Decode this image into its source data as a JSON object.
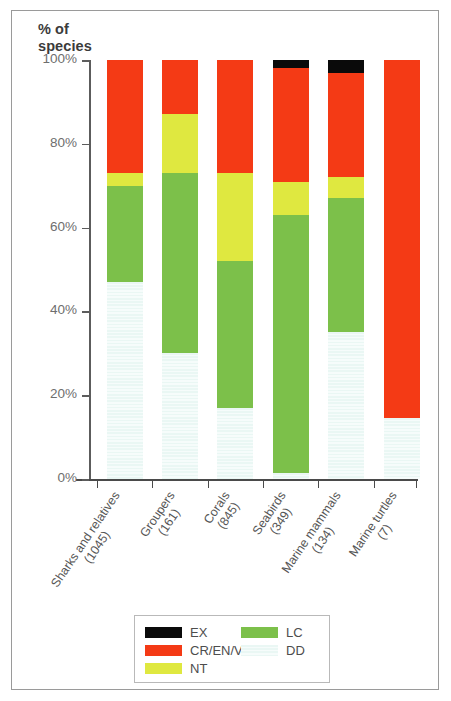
{
  "chart_data": {
    "type": "bar",
    "title": "% of species",
    "xlabel": "",
    "ylabel": "% of species",
    "ylim": [
      0,
      100
    ],
    "grid": false,
    "stacked": true,
    "legend_position": "bottom",
    "y_ticks": [
      "0%",
      "20%",
      "40%",
      "60%",
      "80%",
      "100%"
    ],
    "y_tick_values": [
      0,
      20,
      40,
      60,
      80,
      100
    ],
    "categories": [
      "Sharks and relatives (1045)",
      "Groupers (161)",
      "Corals (845)",
      "Seabirds (349)",
      "Marine mammals (134)",
      "Marine turtles (7)"
    ],
    "category_lines": [
      {
        "line1": "Sharks and relatives",
        "line2": "(1045)"
      },
      {
        "line1": "Groupers",
        "line2": "(161)"
      },
      {
        "line1": "Corals",
        "line2": "(845)"
      },
      {
        "line1": "Seabirds",
        "line2": "(349)"
      },
      {
        "line1": "Marine mammals",
        "line2": "(134)"
      },
      {
        "line1": "Marine turtles",
        "line2": "(7)"
      }
    ],
    "series": [
      {
        "name": "DD",
        "color": "#eaf7f4",
        "values": [
          47.0,
          30.0,
          17.0,
          1.5,
          35.0,
          14.5
        ]
      },
      {
        "name": "LC",
        "color": "#7cc04a",
        "values": [
          23.0,
          43.0,
          35.0,
          61.5,
          32.0,
          0.0
        ]
      },
      {
        "name": "NT",
        "color": "#dfe840",
        "values": [
          3.0,
          14.0,
          21.0,
          8.0,
          5.0,
          0.0
        ]
      },
      {
        "name": "CR/EN/VU",
        "color": "#f43a15",
        "values": [
          27.0,
          13.0,
          27.0,
          27.0,
          25.0,
          85.5
        ]
      },
      {
        "name": "EX",
        "color": "#0a0a0a",
        "values": [
          0.0,
          0.0,
          0.0,
          2.0,
          3.0,
          0.0
        ]
      }
    ],
    "legend": [
      {
        "label": "EX",
        "color": "#0a0a0a",
        "column": "left"
      },
      {
        "label": "CR/EN/VU",
        "color": "#f43a15",
        "column": "left"
      },
      {
        "label": "NT",
        "color": "#dfe840",
        "column": "left"
      },
      {
        "label": "LC",
        "color": "#7cc04a",
        "column": "right"
      },
      {
        "label": "DD",
        "color": "#eaf7f4",
        "column": "right"
      }
    ]
  },
  "axis_title": {
    "line1": "% of",
    "line2": "species"
  }
}
